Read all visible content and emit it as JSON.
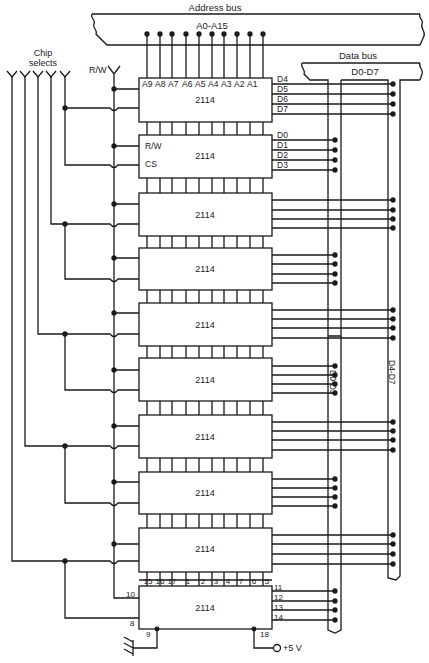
{
  "diagram": {
    "labels": {
      "address_bus": "Address bus",
      "address_range": "A0-A15",
      "data_bus": "Data bus",
      "data_range": "D0-D7",
      "chip_selects": [
        "Chip",
        "selects"
      ],
      "rw": "R/W",
      "bus_low": "D0-D3",
      "bus_high": "D4-D7",
      "power": "+5 V"
    },
    "chip_part": "2114",
    "address_pins": [
      "A9",
      "A8",
      "A7",
      "A6",
      "A5",
      "A4",
      "A3",
      "A2",
      "A1"
    ],
    "chip1_data_pins": [
      "D4",
      "D5",
      "D6",
      "D7"
    ],
    "chip2_data_pins": [
      "D0",
      "D1",
      "D2",
      "D3"
    ],
    "chip2_control_pins": [
      "R/W",
      "CS"
    ],
    "pin_numbers_top": [
      "15",
      "16",
      "17",
      "1",
      "2",
      "3",
      "4",
      "7",
      "6",
      "5"
    ],
    "pin_numbers_right": [
      "11",
      "12",
      "13",
      "14"
    ],
    "pin_numbers_left": [
      "10",
      "8"
    ],
    "pin_numbers_bottom": [
      "9",
      "18"
    ],
    "chip_count": 10,
    "chip_select_lines": 5
  }
}
